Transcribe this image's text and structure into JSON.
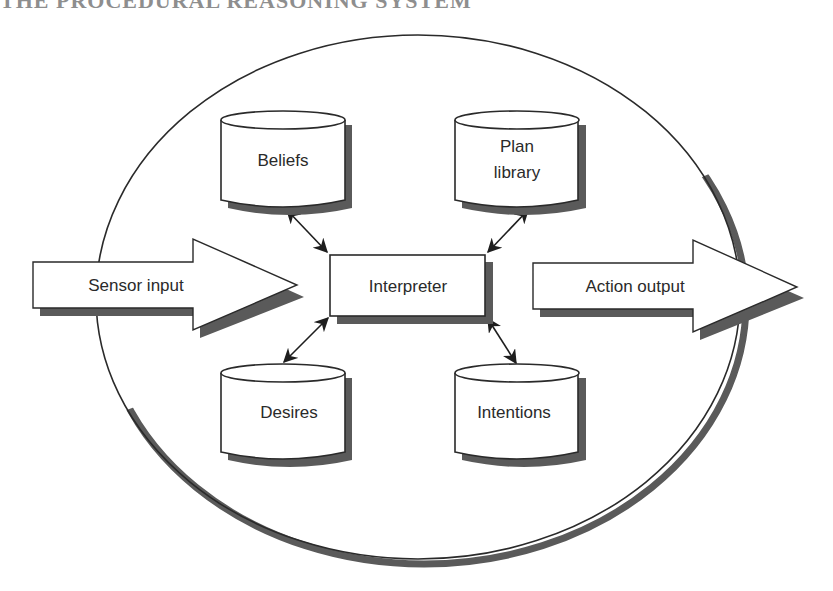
{
  "header": {
    "title_cropped": "THE PROCEDURAL REASONING SYSTEM"
  },
  "diagram": {
    "container": {
      "shape": "ellipse",
      "label": ""
    },
    "stores": [
      {
        "id": "beliefs",
        "label_lines": [
          "Beliefs"
        ]
      },
      {
        "id": "plan-library",
        "label_lines": [
          "Plan",
          "library"
        ]
      },
      {
        "id": "desires",
        "label_lines": [
          "Desires"
        ]
      },
      {
        "id": "intentions",
        "label_lines": [
          "Intentions"
        ]
      }
    ],
    "core": {
      "id": "interpreter",
      "label": "Interpreter"
    },
    "io": {
      "input": {
        "id": "sensor-input",
        "label": "Sensor input"
      },
      "output": {
        "id": "action-output",
        "label": "Action output"
      }
    },
    "connections": [
      {
        "from": "interpreter",
        "to": "beliefs",
        "type": "bidirectional"
      },
      {
        "from": "interpreter",
        "to": "plan-library",
        "type": "bidirectional"
      },
      {
        "from": "interpreter",
        "to": "desires",
        "type": "bidirectional"
      },
      {
        "from": "interpreter",
        "to": "intentions",
        "type": "bidirectional"
      },
      {
        "from": "sensor-input",
        "to": "interpreter",
        "type": "flow"
      },
      {
        "from": "interpreter",
        "to": "action-output",
        "type": "flow"
      }
    ],
    "colors": {
      "stroke": "#2a2a2a",
      "shadow": "#5a5a5a",
      "fill": "#ffffff"
    }
  }
}
